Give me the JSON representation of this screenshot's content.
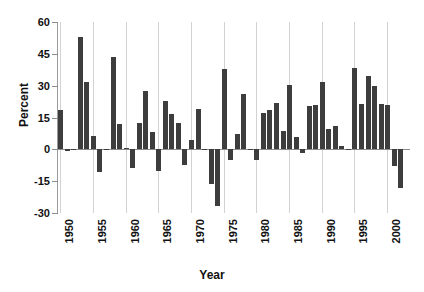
{
  "chart_data": {
    "type": "bar",
    "title": "",
    "subtitle": "",
    "xlabel": "Year",
    "ylabel": "Percent",
    "grid": true,
    "legend": false,
    "bar_color": "#3d3d3d",
    "grid_color": "#d2d2d2",
    "axis_color": "#8c8c8c",
    "ylim": [
      -30,
      60
    ],
    "xlim": [
      1949.5,
      2003.5
    ],
    "ytick_labels": [
      "60",
      "45",
      "30",
      "15",
      "0",
      "-15",
      "-30"
    ],
    "ytick_values": [
      60,
      45,
      30,
      15,
      0,
      -15,
      -30
    ],
    "xtick_labels": [
      "1950",
      "1955",
      "1960",
      "1965",
      "1970",
      "1975",
      "1980",
      "1985",
      "1990",
      "1995",
      "2000"
    ],
    "xtick_values": [
      1950,
      1955,
      1960,
      1965,
      1970,
      1975,
      1980,
      1985,
      1990,
      1995,
      2000
    ],
    "categories": [
      1950,
      1951,
      1952,
      1953,
      1954,
      1955,
      1956,
      1957,
      1958,
      1959,
      1960,
      1961,
      1962,
      1963,
      1964,
      1965,
      1966,
      1967,
      1968,
      1969,
      1970,
      1971,
      1972,
      1973,
      1974,
      1975,
      1976,
      1977,
      1978,
      1979,
      1980,
      1981,
      1982,
      1983,
      1984,
      1985,
      1986,
      1987,
      1988,
      1989,
      1990,
      1991,
      1992,
      1993,
      1994,
      1995,
      1996,
      1997,
      1998,
      1999,
      2000,
      2001,
      2002
    ],
    "values": [
      18.5,
      -1.0,
      0.0,
      53.0,
      31.5,
      6.5,
      -10.5,
      0.0,
      43.5,
      12.0,
      0.5,
      -9.0,
      12.5,
      27.5,
      8.0,
      -10.0,
      23.0,
      16.5,
      12.5,
      -7.5,
      4.5,
      19.0,
      0.0,
      -16.5,
      -26.5,
      38.0,
      -5.0,
      7.0,
      26.0,
      0.0,
      -5.0,
      17.0,
      18.5,
      22.0,
      8.5,
      30.5,
      6.0,
      -1.5,
      20.5,
      21.0,
      31.5,
      9.5,
      11.0,
      1.5,
      -0.5,
      38.5,
      21.5,
      34.5,
      30.0,
      21.5,
      21.0,
      -8.0,
      -18.0
    ],
    "series": [
      {
        "name": "Percent",
        "values": [
          18.5,
          -1.0,
          0.0,
          53.0,
          31.5,
          6.5,
          -10.5,
          0.0,
          43.5,
          12.0,
          0.5,
          -9.0,
          12.5,
          27.5,
          8.0,
          -10.0,
          23.0,
          16.5,
          12.5,
          -7.5,
          4.5,
          19.0,
          0.0,
          -16.5,
          -26.5,
          38.0,
          -5.0,
          7.0,
          26.0,
          0.0,
          -5.0,
          17.0,
          18.5,
          22.0,
          8.5,
          30.5,
          6.0,
          -1.5,
          20.5,
          21.0,
          31.5,
          9.5,
          11.0,
          1.5,
          -0.5,
          38.5,
          21.5,
          34.5,
          30.0,
          21.5,
          21.0,
          -8.0,
          -18.0
        ]
      }
    ]
  }
}
